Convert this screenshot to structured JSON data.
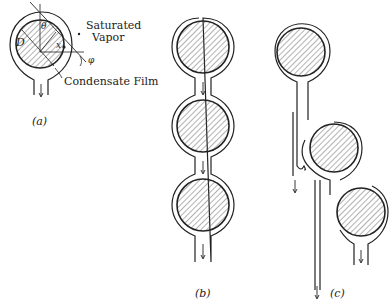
{
  "figure": {
    "panel_a": {
      "caption": "(a)",
      "labels": {
        "saturated_vapor_line1": "Saturated",
        "saturated_vapor_line2": "Vapor",
        "condensate_film": "Condensate Film",
        "diameter": "D",
        "theta": "θ",
        "x": "x",
        "phi": "φ"
      }
    },
    "panel_b": {
      "caption": "(b)"
    },
    "panel_c": {
      "caption": "(c)"
    }
  },
  "colors": {
    "line": "#222222",
    "background": "#ffffff",
    "hatch": "#444444"
  }
}
